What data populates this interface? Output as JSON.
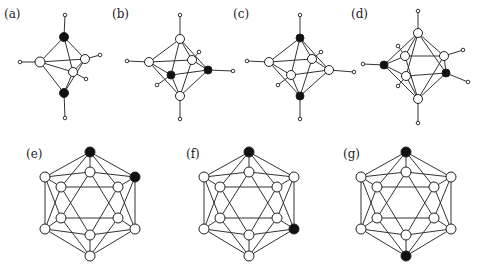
{
  "figure": {
    "colors": {
      "white_node": "#ffffff",
      "black_node": "#111111",
      "edge": "#333333"
    },
    "panels": [
      {
        "id": "a",
        "label": "(a)",
        "label_pos": [
          4,
          8
        ],
        "shape": "trigonal-bipyramid",
        "nodes": [
          {
            "id": "top",
            "x": 64,
            "y": 37,
            "r": 4.5,
            "fill": "black"
          },
          {
            "id": "left",
            "x": 40,
            "y": 62,
            "r": 5,
            "fill": "white"
          },
          {
            "id": "right",
            "x": 85,
            "y": 59,
            "r": 4.5,
            "fill": "white"
          },
          {
            "id": "front",
            "x": 73,
            "y": 72,
            "r": 4.5,
            "fill": "white"
          },
          {
            "id": "bottom",
            "x": 64,
            "y": 93,
            "r": 4.5,
            "fill": "black"
          }
        ],
        "stubs": [
          {
            "from": "top",
            "x": 65,
            "y": 15
          },
          {
            "from": "left",
            "x": 20,
            "y": 62
          },
          {
            "from": "right",
            "x": 100,
            "y": 55
          },
          {
            "from": "front",
            "x": 86,
            "y": 79
          },
          {
            "from": "bottom",
            "x": 65,
            "y": 118
          }
        ],
        "edges": [
          [
            "top",
            "left"
          ],
          [
            "top",
            "right"
          ],
          [
            "top",
            "front"
          ],
          [
            "bottom",
            "left"
          ],
          [
            "bottom",
            "right"
          ],
          [
            "bottom",
            "front"
          ],
          [
            "left",
            "right"
          ],
          [
            "left",
            "front"
          ],
          [
            "right",
            "front"
          ]
        ]
      },
      {
        "id": "b",
        "label": "(b)",
        "label_pos": [
          112,
          8
        ],
        "shape": "octahedron",
        "nodes": [
          {
            "id": "top",
            "x": 180,
            "y": 39,
            "r": 4.5,
            "fill": "white"
          },
          {
            "id": "left",
            "x": 149,
            "y": 62,
            "r": 4.5,
            "fill": "white"
          },
          {
            "id": "backright",
            "x": 192,
            "y": 60,
            "r": 4.5,
            "fill": "white"
          },
          {
            "id": "frontleft",
            "x": 171,
            "y": 75,
            "r": 4,
            "fill": "black"
          },
          {
            "id": "right",
            "x": 208,
            "y": 70,
            "r": 4,
            "fill": "black"
          },
          {
            "id": "bottom",
            "x": 180,
            "y": 96,
            "r": 4.5,
            "fill": "white"
          }
        ],
        "stubs": [
          {
            "from": "top",
            "x": 180,
            "y": 15
          },
          {
            "from": "left",
            "x": 127,
            "y": 61
          },
          {
            "from": "backright",
            "x": 199,
            "y": 52
          },
          {
            "from": "frontleft",
            "x": 157,
            "y": 85
          },
          {
            "from": "right",
            "x": 233,
            "y": 71
          },
          {
            "from": "bottom",
            "x": 180,
            "y": 119
          }
        ],
        "edges": [
          [
            "top",
            "left"
          ],
          [
            "top",
            "backright"
          ],
          [
            "top",
            "frontleft"
          ],
          [
            "top",
            "right"
          ],
          [
            "bottom",
            "left"
          ],
          [
            "bottom",
            "backright"
          ],
          [
            "bottom",
            "frontleft"
          ],
          [
            "bottom",
            "right"
          ],
          [
            "left",
            "backright"
          ],
          [
            "backright",
            "right"
          ],
          [
            "right",
            "frontleft"
          ],
          [
            "frontleft",
            "left"
          ]
        ]
      },
      {
        "id": "c",
        "label": "(c)",
        "label_pos": [
          233,
          8
        ],
        "shape": "octahedron",
        "nodes": [
          {
            "id": "top",
            "x": 300,
            "y": 38,
            "r": 4,
            "fill": "black"
          },
          {
            "id": "left",
            "x": 269,
            "y": 62,
            "r": 4.5,
            "fill": "white"
          },
          {
            "id": "backright",
            "x": 312,
            "y": 59,
            "r": 4.5,
            "fill": "white"
          },
          {
            "id": "front",
            "x": 291,
            "y": 75,
            "r": 4.5,
            "fill": "white"
          },
          {
            "id": "right",
            "x": 329,
            "y": 70,
            "r": 4.5,
            "fill": "white"
          },
          {
            "id": "bottom",
            "x": 300,
            "y": 96,
            "r": 4,
            "fill": "black"
          }
        ],
        "stubs": [
          {
            "from": "top",
            "x": 300,
            "y": 15
          },
          {
            "from": "left",
            "x": 247,
            "y": 61
          },
          {
            "from": "backright",
            "x": 321,
            "y": 52
          },
          {
            "from": "front",
            "x": 278,
            "y": 85
          },
          {
            "from": "right",
            "x": 354,
            "y": 72
          },
          {
            "from": "bottom",
            "x": 300,
            "y": 119
          }
        ],
        "edges": [
          [
            "top",
            "left"
          ],
          [
            "top",
            "backright"
          ],
          [
            "top",
            "front"
          ],
          [
            "top",
            "right"
          ],
          [
            "bottom",
            "left"
          ],
          [
            "bottom",
            "backright"
          ],
          [
            "bottom",
            "front"
          ],
          [
            "bottom",
            "right"
          ],
          [
            "left",
            "backright"
          ],
          [
            "backright",
            "right"
          ],
          [
            "right",
            "front"
          ],
          [
            "front",
            "left"
          ]
        ]
      },
      {
        "id": "d",
        "label": "(d)",
        "label_pos": [
          351,
          8
        ],
        "shape": "pentagonal-bipyramid",
        "nodes": [
          {
            "id": "top",
            "x": 418,
            "y": 33,
            "r": 4.5,
            "fill": "white"
          },
          {
            "id": "backleft",
            "x": 405,
            "y": 56,
            "r": 4.5,
            "fill": "white"
          },
          {
            "id": "backright",
            "x": 444,
            "y": 56,
            "r": 4.5,
            "fill": "white"
          },
          {
            "id": "left",
            "x": 384,
            "y": 65,
            "r": 4,
            "fill": "black"
          },
          {
            "id": "frontleft",
            "x": 406,
            "y": 76,
            "r": 4.5,
            "fill": "white"
          },
          {
            "id": "right",
            "x": 446,
            "y": 73,
            "r": 4,
            "fill": "black"
          },
          {
            "id": "bottom",
            "x": 418,
            "y": 99,
            "r": 4.5,
            "fill": "white"
          }
        ],
        "stubs": [
          {
            "from": "top",
            "x": 418,
            "y": 11
          },
          {
            "from": "backleft",
            "x": 398,
            "y": 46
          },
          {
            "from": "backright",
            "x": 463,
            "y": 50
          },
          {
            "from": "left",
            "x": 363,
            "y": 64
          },
          {
            "from": "frontleft",
            "x": 398,
            "y": 86
          },
          {
            "from": "right",
            "x": 468,
            "y": 82
          },
          {
            "from": "bottom",
            "x": 418,
            "y": 123
          }
        ],
        "edges": [
          [
            "top",
            "left"
          ],
          [
            "top",
            "backleft"
          ],
          [
            "top",
            "backright"
          ],
          [
            "top",
            "right"
          ],
          [
            "top",
            "frontleft"
          ],
          [
            "bottom",
            "left"
          ],
          [
            "bottom",
            "backleft"
          ],
          [
            "bottom",
            "backright"
          ],
          [
            "bottom",
            "right"
          ],
          [
            "bottom",
            "frontleft"
          ],
          [
            "left",
            "backleft"
          ],
          [
            "backleft",
            "backright"
          ],
          [
            "backright",
            "right"
          ],
          [
            "right",
            "frontleft"
          ],
          [
            "frontleft",
            "left"
          ]
        ]
      },
      {
        "id": "e",
        "label": "(e)",
        "label_pos": [
          26,
          148
        ],
        "shape": "icosahedron",
        "center_x": 90,
        "black_nodes": [
          "T",
          "O2"
        ]
      },
      {
        "id": "f",
        "label": "(f)",
        "label_pos": [
          186,
          148
        ],
        "shape": "icosahedron",
        "center_x": 249,
        "black_nodes": [
          "T",
          "O3"
        ]
      },
      {
        "id": "g",
        "label": "(g)",
        "label_pos": [
          343,
          148
        ],
        "shape": "icosahedron",
        "center_x": 406,
        "black_nodes": [
          "T",
          "B"
        ]
      }
    ],
    "icosahedron_template": {
      "nodes": [
        {
          "id": "T",
          "dx": 0,
          "y": 152,
          "r": 5
        },
        {
          "id": "O1",
          "dx": -45,
          "y": 177,
          "r": 5
        },
        {
          "id": "O2",
          "dx": 45,
          "y": 177,
          "r": 5
        },
        {
          "id": "O3",
          "dx": 45,
          "y": 229,
          "r": 5
        },
        {
          "id": "O4",
          "dx": -45,
          "y": 229,
          "r": 5
        },
        {
          "id": "B",
          "dx": 0,
          "y": 256,
          "r": 5
        },
        {
          "id": "I0",
          "dx": 0,
          "y": 172,
          "r": 5
        },
        {
          "id": "I1",
          "dx": 28,
          "y": 187,
          "r": 5
        },
        {
          "id": "I2",
          "dx": 28,
          "y": 218,
          "r": 5
        },
        {
          "id": "I3",
          "dx": 0,
          "y": 235,
          "r": 5
        },
        {
          "id": "I4",
          "dx": -29,
          "y": 218,
          "r": 5
        },
        {
          "id": "I5",
          "dx": -29,
          "y": 187,
          "r": 5
        }
      ],
      "edges": [
        [
          "T",
          "O1"
        ],
        [
          "T",
          "O2"
        ],
        [
          "T",
          "I0"
        ],
        [
          "T",
          "I5"
        ],
        [
          "T",
          "I1"
        ],
        [
          "B",
          "O4"
        ],
        [
          "B",
          "O3"
        ],
        [
          "B",
          "I3"
        ],
        [
          "B",
          "I4"
        ],
        [
          "B",
          "I2"
        ],
        [
          "O1",
          "O4"
        ],
        [
          "O1",
          "I0"
        ],
        [
          "O1",
          "I5"
        ],
        [
          "O1",
          "I4"
        ],
        [
          "O2",
          "O3"
        ],
        [
          "O2",
          "I0"
        ],
        [
          "O2",
          "I1"
        ],
        [
          "O2",
          "I2"
        ],
        [
          "O3",
          "I1"
        ],
        [
          "O3",
          "I2"
        ],
        [
          "O3",
          "I3"
        ],
        [
          "O4",
          "I5"
        ],
        [
          "O4",
          "I4"
        ],
        [
          "O4",
          "I3"
        ],
        [
          "I0",
          "I4"
        ],
        [
          "I0",
          "I2"
        ],
        [
          "I3",
          "I5"
        ],
        [
          "I3",
          "I1"
        ],
        [
          "I5",
          "I1"
        ],
        [
          "I4",
          "I2"
        ]
      ]
    }
  }
}
